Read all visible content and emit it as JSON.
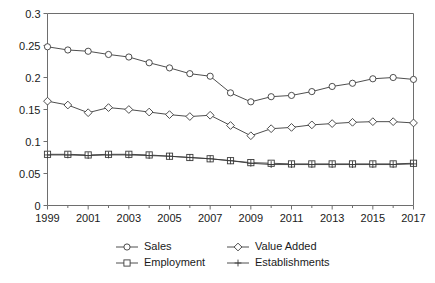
{
  "chart_data": {
    "type": "line",
    "title": "",
    "subtitle": "",
    "xlabel": "",
    "ylabel": "",
    "xlim": [
      1999,
      2017
    ],
    "ylim": [
      0,
      0.3
    ],
    "grid": false,
    "legend_position": "bottom",
    "x": [
      1999,
      2000,
      2001,
      2002,
      2003,
      2004,
      2005,
      2006,
      2007,
      2008,
      2009,
      2010,
      2011,
      2012,
      2013,
      2014,
      2015,
      2016,
      2017
    ],
    "x_tick_labels": [
      "1999",
      "2001",
      "2003",
      "2005",
      "2007",
      "2009",
      "2011",
      "2013",
      "2015",
      "2017"
    ],
    "x_ticks": [
      1999,
      2001,
      2003,
      2005,
      2007,
      2009,
      2011,
      2013,
      2015,
      2017
    ],
    "y_ticks": [
      0,
      0.05,
      0.1,
      0.15,
      0.2,
      0.25,
      0.3
    ],
    "y_tick_labels": [
      "0",
      "0.05",
      "0.1",
      "0.15",
      "0.2",
      "0.25",
      "0.3"
    ],
    "series": [
      {
        "name": "Sales",
        "marker": "circle",
        "color": "#3a3a3a",
        "values": [
          0.248,
          0.243,
          0.241,
          0.236,
          0.232,
          0.223,
          0.215,
          0.206,
          0.202,
          0.176,
          0.162,
          0.17,
          0.172,
          0.178,
          0.186,
          0.191,
          0.198,
          0.2,
          0.197
        ]
      },
      {
        "name": "Value Added",
        "marker": "diamond",
        "color": "#3a3a3a",
        "values": [
          0.163,
          0.157,
          0.145,
          0.153,
          0.15,
          0.146,
          0.142,
          0.139,
          0.141,
          0.125,
          0.109,
          0.12,
          0.122,
          0.126,
          0.128,
          0.13,
          0.131,
          0.131,
          0.129
        ]
      },
      {
        "name": "Employment",
        "marker": "square",
        "color": "#3a3a3a",
        "values": [
          0.08,
          0.08,
          0.079,
          0.08,
          0.08,
          0.079,
          0.077,
          0.075,
          0.073,
          0.07,
          0.067,
          0.066,
          0.065,
          0.065,
          0.065,
          0.065,
          0.065,
          0.065,
          0.066
        ]
      },
      {
        "name": "Establishments",
        "marker": "plus",
        "color": "#3a3a3a",
        "values": [
          0.079,
          0.079,
          0.078,
          0.079,
          0.079,
          0.078,
          0.077,
          0.075,
          0.073,
          0.07,
          0.066,
          0.064,
          0.064,
          0.064,
          0.064,
          0.064,
          0.064,
          0.064,
          0.065
        ]
      }
    ]
  },
  "legend": {
    "items": [
      {
        "label": "Sales",
        "marker": "circle"
      },
      {
        "label": "Value Added",
        "marker": "diamond"
      },
      {
        "label": "Employment",
        "marker": "square"
      },
      {
        "label": "Establishments",
        "marker": "plus"
      }
    ]
  }
}
